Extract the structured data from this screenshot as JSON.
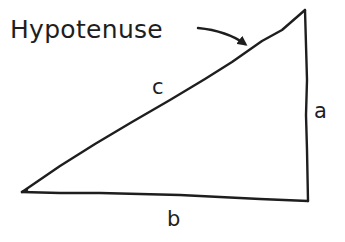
{
  "diagram": {
    "type": "right-triangle",
    "annotation": {
      "text": "Hypotenuse",
      "points_to": "side-c"
    },
    "sides": {
      "a": "a",
      "b": "b",
      "c": "c"
    },
    "colors": {
      "ink": "#1e1e1e",
      "background": "#ffffff"
    }
  }
}
